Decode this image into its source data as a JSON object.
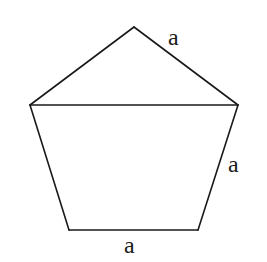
{
  "diagram": {
    "type": "geometry",
    "shape": "regular pentagon divided by a diagonal into a triangle and a trapezoid",
    "vertices": {
      "apex": [
        134,
        27
      ],
      "left": [
        30,
        105
      ],
      "right": [
        238,
        105
      ],
      "bottom_right": [
        198,
        230
      ],
      "bottom_left": [
        69,
        230
      ]
    },
    "edges": [
      {
        "from": "apex",
        "to": "right",
        "label": "a"
      },
      {
        "from": "right",
        "to": "bottom_right",
        "label": "a"
      },
      {
        "from": "bottom_right",
        "to": "bottom_left",
        "label": "a"
      },
      {
        "from": "bottom_left",
        "to": "left",
        "label": ""
      },
      {
        "from": "left",
        "to": "apex",
        "label": ""
      },
      {
        "from": "left",
        "to": "right",
        "label": "",
        "kind": "diagonal"
      }
    ],
    "labels": {
      "top_right_side": "a",
      "right_side": "a",
      "bottom_side": "a"
    },
    "colors": {
      "stroke": "#1a1a1a",
      "background": "#ffffff"
    }
  }
}
